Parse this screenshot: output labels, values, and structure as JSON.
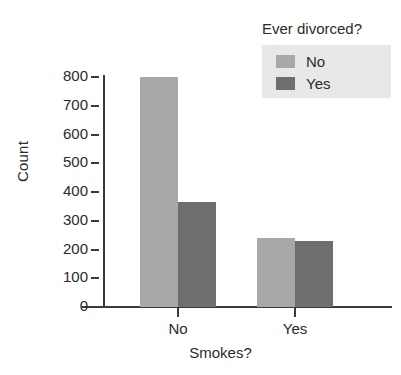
{
  "chart_data": {
    "type": "bar",
    "title": "",
    "xlabel": "Smokes?",
    "ylabel": "Count",
    "categories": [
      "No",
      "Yes"
    ],
    "series": [
      {
        "name": "No",
        "values": [
          800,
          240
        ],
        "color": "#a8a8a8"
      },
      {
        "name": "Yes",
        "values": [
          365,
          230
        ],
        "color": "#6e6e6e"
      }
    ],
    "legend": {
      "title": "Ever divorced?",
      "position": "top-right",
      "background": "#e8e8e8",
      "entries": [
        {
          "label": "No",
          "color": "#a8a8a8"
        },
        {
          "label": "Yes",
          "color": "#6e6e6e"
        }
      ]
    },
    "yticks": [
      "0",
      "100",
      "200",
      "300",
      "400",
      "500",
      "600",
      "700",
      "800"
    ],
    "ytick_values": [
      0,
      100,
      200,
      300,
      400,
      500,
      600,
      700,
      800
    ],
    "ylim": [
      0,
      800
    ],
    "grid": false,
    "grouping": "grouped",
    "axis_color": "#3a3a3a",
    "background": "#ffffff"
  }
}
